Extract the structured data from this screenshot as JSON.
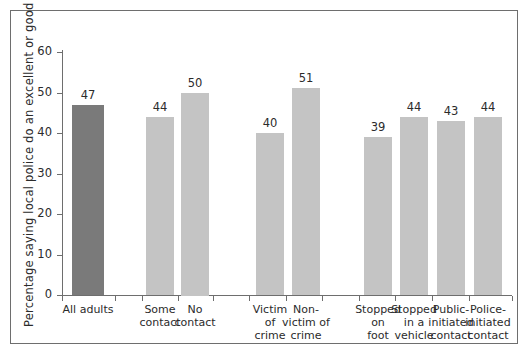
{
  "chart_data": {
    "type": "bar",
    "title": "",
    "subtitle": "",
    "xlabel": "",
    "ylabel": "Percentage saying local police do an excellent or good job",
    "ylim": [
      0,
      60
    ],
    "yticks": [
      0,
      10,
      20,
      30,
      40,
      50,
      60
    ],
    "grid": false,
    "legend": "none",
    "categories": [
      "All adults",
      "Some contact",
      "No contact",
      "Victim of crime",
      "Non-victim of crime",
      "Stopped on foot",
      "Stopped in a vehicle",
      "Public-initiated contact",
      "Police-initiated contact"
    ],
    "values": [
      47,
      44,
      50,
      40,
      51,
      39,
      44,
      43,
      44
    ],
    "bar_colors": [
      "#7a7a7a",
      "#c4c4c4",
      "#c4c4c4",
      "#c4c4c4",
      "#c4c4c4",
      "#c4c4c4",
      "#c4c4c4",
      "#c4c4c4",
      "#c4c4c4"
    ],
    "groups": [
      {
        "name": "all-adults",
        "categories": [
          "All adults"
        ]
      },
      {
        "name": "contact",
        "categories": [
          "Some contact",
          "No contact"
        ]
      },
      {
        "name": "victimization",
        "categories": [
          "Victim of crime",
          "Non-victim of crime"
        ]
      },
      {
        "name": "stop-and-contact-type",
        "categories": [
          "Stopped on foot",
          "Stopped in a vehicle",
          "Public-initiated contact",
          "Police-initiated contact"
        ]
      }
    ]
  },
  "bars": [
    {
      "label": "All adults",
      "label_lines": "All adults",
      "value": 47,
      "value_text": "47",
      "color": "#7a7a7a",
      "x": 72,
      "width": 32
    },
    {
      "label": "Some contact",
      "label_lines": "Some\ncontact",
      "value": 44,
      "value_text": "44",
      "color": "#c4c4c4",
      "x": 146,
      "width": 28
    },
    {
      "label": "No contact",
      "label_lines": "No\ncontact",
      "value": 50,
      "value_text": "50",
      "color": "#c4c4c4",
      "x": 181,
      "width": 28
    },
    {
      "label": "Victim of crime",
      "label_lines": "Victim\nof\ncrime",
      "value": 40,
      "value_text": "40",
      "color": "#c4c4c4",
      "x": 256,
      "width": 28
    },
    {
      "label": "Non-victim of crime",
      "label_lines": "Non-\nvictim of\ncrime",
      "value": 51,
      "value_text": "51",
      "color": "#c4c4c4",
      "x": 292,
      "width": 28
    },
    {
      "label": "Stopped on foot",
      "label_lines": "Stopped\non\nfoot",
      "value": 39,
      "value_text": "39",
      "color": "#c4c4c4",
      "x": 364,
      "width": 28
    },
    {
      "label": "Stopped in a vehicle",
      "label_lines": "Stopped\nin a\nvehicle",
      "value": 44,
      "value_text": "44",
      "color": "#c4c4c4",
      "x": 400,
      "width": 28
    },
    {
      "label": "Public-initiated contact",
      "label_lines": "Public-\ninitiated\ncontact",
      "value": 43,
      "value_text": "43",
      "color": "#c4c4c4",
      "x": 437,
      "width": 28
    },
    {
      "label": "Police-initiated contact",
      "label_lines": "Police-\ninitiated\ncontact",
      "value": 44,
      "value_text": "44",
      "color": "#c4c4c4",
      "x": 474,
      "width": 28
    }
  ],
  "axis": {
    "y_tick_labels": [
      "60",
      "50",
      "40",
      "30",
      "20",
      "10",
      "0"
    ],
    "y_tick_values": [
      60,
      50,
      40,
      30,
      20,
      10,
      0
    ],
    "x_tick_positions": [
      62,
      115,
      142,
      178,
      213,
      249,
      286,
      322,
      359,
      395,
      432,
      469,
      512
    ]
  },
  "colors": {
    "highlight_bar": "#7a7a7a",
    "standard_bar": "#c4c4c4",
    "axis": "#6e6e6e",
    "text": "#2b2b2b",
    "background": "#ffffff",
    "frame": "#6e6e6e"
  }
}
